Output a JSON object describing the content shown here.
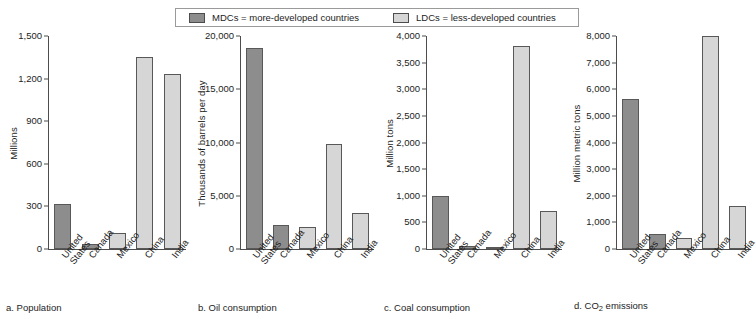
{
  "legend": {
    "entries": [
      {
        "key": "mdc",
        "label": "MDCs = more-developed countries",
        "swatch_color": "#8d8d8d"
      },
      {
        "key": "ldc",
        "label": "LDCs = less-developed countries",
        "swatch_color": "#d6d6d6"
      }
    ]
  },
  "colors": {
    "mdc_fill": "#8d8d8d",
    "ldc_fill": "#d6d6d6",
    "bar_outline": "#585858",
    "axis": "#4d4d4d",
    "background": "#ffffff"
  },
  "chart_data": [
    {
      "id": "a",
      "type": "bar",
      "title": "a. Population",
      "subtitle_prefix": "a. ",
      "subtitle_text": "Population",
      "xlabel": "",
      "ylabel": "Millions",
      "ylim": [
        0,
        1500
      ],
      "yticks": [
        0,
        300,
        600,
        900,
        1200,
        1500
      ],
      "ytick_labels": [
        "0",
        "300",
        "600",
        "900",
        "1,200",
        "1,500"
      ],
      "grid": false,
      "legend_position": "top-center",
      "categories": [
        "United\nStates",
        "Canada",
        "Mexico",
        "China",
        "India"
      ],
      "category_plain": [
        "United States",
        "Canada",
        "Mexico",
        "China",
        "India"
      ],
      "groups": [
        "mdc",
        "mdc",
        "ldc",
        "ldc",
        "ldc"
      ],
      "values": [
        315,
        33,
        115,
        1355,
        1235
      ]
    },
    {
      "id": "b",
      "type": "bar",
      "title": "b. Oil consumption",
      "subtitle_prefix": "b. ",
      "subtitle_text": "Oil consumption",
      "xlabel": "",
      "ylabel": "Thousands of barrels per day",
      "ylim": [
        0,
        20000
      ],
      "yticks": [
        0,
        5000,
        10000,
        15000,
        20000
      ],
      "ytick_labels": [
        "0",
        "5,000",
        "10,000",
        "15,000",
        "20,000"
      ],
      "grid": false,
      "legend_position": "top-center",
      "categories": [
        "United\nStates",
        "Canada",
        "Mexico",
        "China",
        "India"
      ],
      "category_plain": [
        "United States",
        "Canada",
        "Mexico",
        "China",
        "India"
      ],
      "groups": [
        "mdc",
        "mdc",
        "ldc",
        "ldc",
        "ldc"
      ],
      "values": [
        18900,
        2300,
        2100,
        9900,
        3400
      ]
    },
    {
      "id": "c",
      "type": "bar",
      "title": "c. Coal consumption",
      "subtitle_prefix": "c. ",
      "subtitle_text": "Coal consumption",
      "xlabel": "",
      "ylabel": "Million tons",
      "ylim": [
        0,
        4000
      ],
      "yticks": [
        0,
        500,
        1000,
        1500,
        2000,
        2500,
        3000,
        3500,
        4000
      ],
      "ytick_labels": [
        "0",
        "500",
        "1,000",
        "1,500",
        "2,000",
        "2,500",
        "3,000",
        "3,500",
        "4,000"
      ],
      "grid": false,
      "legend_position": "top-center",
      "categories": [
        "United\nStates",
        "Canada",
        "Mexico",
        "China",
        "India"
      ],
      "category_plain": [
        "United States",
        "Canada",
        "Mexico",
        "China",
        "India"
      ],
      "groups": [
        "mdc",
        "mdc",
        "ldc",
        "ldc",
        "ldc"
      ],
      "values": [
        1000,
        50,
        20,
        3820,
        720
      ]
    },
    {
      "id": "d",
      "type": "bar",
      "title": "d. CO2 emissions",
      "subtitle_prefix": "d. CO",
      "subtitle_sub": "2",
      "subtitle_text": " emissions",
      "xlabel": "",
      "ylabel": "Million metric tons",
      "ylim": [
        0,
        8000
      ],
      "yticks": [
        0,
        1000,
        2000,
        3000,
        4000,
        5000,
        6000,
        7000,
        8000
      ],
      "ytick_labels": [
        "0",
        "1,000",
        "2,000",
        "3,000",
        "4,000",
        "5,000",
        "6,000",
        "7,000",
        "8,000"
      ],
      "grid": false,
      "legend_position": "top-center",
      "categories": [
        "United\nStates",
        "Canada",
        "Mexico",
        "China",
        "India"
      ],
      "category_plain": [
        "United States",
        "Canada",
        "Mexico",
        "China",
        "India"
      ],
      "groups": [
        "mdc",
        "mdc",
        "ldc",
        "ldc",
        "ldc"
      ],
      "values": [
        5650,
        550,
        420,
        8000,
        1600
      ]
    }
  ]
}
